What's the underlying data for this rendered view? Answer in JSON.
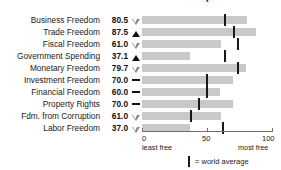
{
  "title": "FREEDOM SCORES FOR THIS COUNTRY (10 FREEDOMS)",
  "axis": {
    "ticks": [
      {
        "value": 0,
        "label": "0"
      },
      {
        "value": 50,
        "label": "50"
      },
      {
        "value": 100,
        "label": "100"
      }
    ],
    "left_caption": "least free",
    "right_caption": "most free"
  },
  "legend": {
    "marker_label": "= world average",
    "marker_name": "world-average-tick"
  },
  "colors": {
    "bar": "#c9c9c9",
    "average_tick": "#1a1a1a",
    "axis": "#6f6f6f",
    "text": "#1a1a1a",
    "arrow_up": "#111111",
    "arrow_down": "#8a8a8a"
  },
  "chart_data": {
    "type": "bar",
    "title": "FREEDOM SCORES FOR THIS COUNTRY (10 FREEDOMS)",
    "xlabel": "",
    "ylabel": "",
    "xlim": [
      0,
      100
    ],
    "grid": false,
    "orientation": "horizontal",
    "legend_position": "bottom-center",
    "categories": [
      "Business Freedom",
      "Trade Freedom",
      "Fiscal Freedom",
      "Government Spending",
      "Monetary Freedom",
      "Investment Freedom",
      "Financial Freedom",
      "Property Rights",
      "Fdm. from Corruption",
      "Labor Freedom"
    ],
    "values": [
      80.5,
      87.5,
      61.0,
      37.1,
      79.7,
      70.0,
      60.0,
      70.0,
      61.0,
      37.0
    ],
    "world_average": [
      63.5,
      71.0,
      74.0,
      64.0,
      74.0,
      50.0,
      50.0,
      44.0,
      38.0,
      62.0
    ],
    "trend": [
      "down",
      "up",
      "down",
      "up",
      "down",
      "flat",
      "flat",
      "flat",
      "down",
      "down"
    ],
    "series": [
      {
        "name": "Country score",
        "values": [
          80.5,
          87.5,
          61.0,
          37.1,
          79.7,
          70.0,
          60.0,
          70.0,
          61.0,
          37.0
        ]
      },
      {
        "name": "World average",
        "values": [
          63.5,
          71.0,
          74.0,
          64.0,
          74.0,
          50.0,
          50.0,
          44.0,
          38.0,
          62.0
        ]
      }
    ]
  },
  "rows": [
    {
      "label": "Business Freedom",
      "value": "80.5",
      "trend": "down"
    },
    {
      "label": "Trade Freedom",
      "value": "87.5",
      "trend": "up"
    },
    {
      "label": "Fiscal Freedom",
      "value": "61.0",
      "trend": "down"
    },
    {
      "label": "Government Spending",
      "value": "37.1",
      "trend": "up"
    },
    {
      "label": "Monetary Freedom",
      "value": "79.7",
      "trend": "down"
    },
    {
      "label": "Investment Freedom",
      "value": "70.0",
      "trend": "flat"
    },
    {
      "label": "Financial Freedom",
      "value": "60.0",
      "trend": "flat"
    },
    {
      "label": "Property Rights",
      "value": "70.0",
      "trend": "flat"
    },
    {
      "label": "Fdm. from Corruption",
      "value": "61.0",
      "trend": "down"
    },
    {
      "label": "Labor Freedom",
      "value": "37.0",
      "trend": "down"
    }
  ]
}
